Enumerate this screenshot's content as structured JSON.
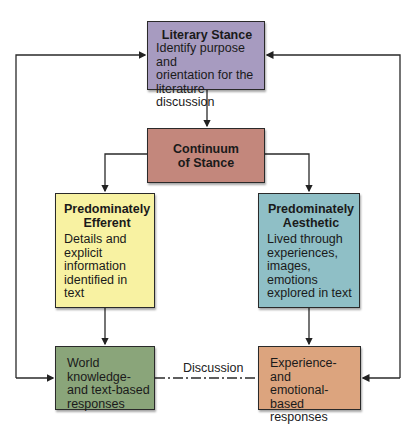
{
  "diagram": {
    "nodes": [
      {
        "id": "literary_stance",
        "title": "Literary Stance",
        "body": [
          "Identify purpose and",
          "orientation for the",
          "literature discussion"
        ],
        "color": "#a79bc0"
      },
      {
        "id": "continuum",
        "title": [
          "Continuum",
          "of Stance"
        ],
        "color": "#c3877c"
      },
      {
        "id": "efferent",
        "title": [
          "Predominately",
          "Efferent"
        ],
        "body": [
          "Details and",
          "explicit",
          "information",
          "identified in",
          "text"
        ],
        "color": "#f8f2a2"
      },
      {
        "id": "aesthetic",
        "title": [
          "Predominately",
          "Aesthetic"
        ],
        "body": [
          "Lived through",
          "experiences,",
          "images, emotions",
          "explored in text"
        ],
        "color": "#8fbfc6"
      },
      {
        "id": "world_knowledge",
        "body": [
          "World knowledge-",
          "and text-based",
          "responses"
        ],
        "color": "#8aa57a"
      },
      {
        "id": "experience",
        "body": [
          "Experience- and",
          "emotional-based",
          "responses"
        ],
        "color": "#dca47e"
      }
    ],
    "edges": [
      {
        "from": "literary_stance",
        "to": "continuum",
        "style": "solid-arrow"
      },
      {
        "from": "continuum",
        "to": "efferent",
        "style": "solid-arrow"
      },
      {
        "from": "continuum",
        "to": "aesthetic",
        "style": "solid-arrow"
      },
      {
        "from": "efferent",
        "to": "world_knowledge",
        "style": "solid-arrow"
      },
      {
        "from": "aesthetic",
        "to": "experience",
        "style": "solid-arrow"
      },
      {
        "from": "literary_stance",
        "to": "world_knowledge",
        "style": "solid-arrow-loop-left"
      },
      {
        "from": "experience",
        "to": "literary_stance",
        "style": "solid-arrow-loop-right"
      },
      {
        "from": "world_knowledge",
        "to": "experience",
        "style": "dash-dot",
        "label": "Discussion"
      }
    ],
    "discussion_label": "Discussion"
  }
}
